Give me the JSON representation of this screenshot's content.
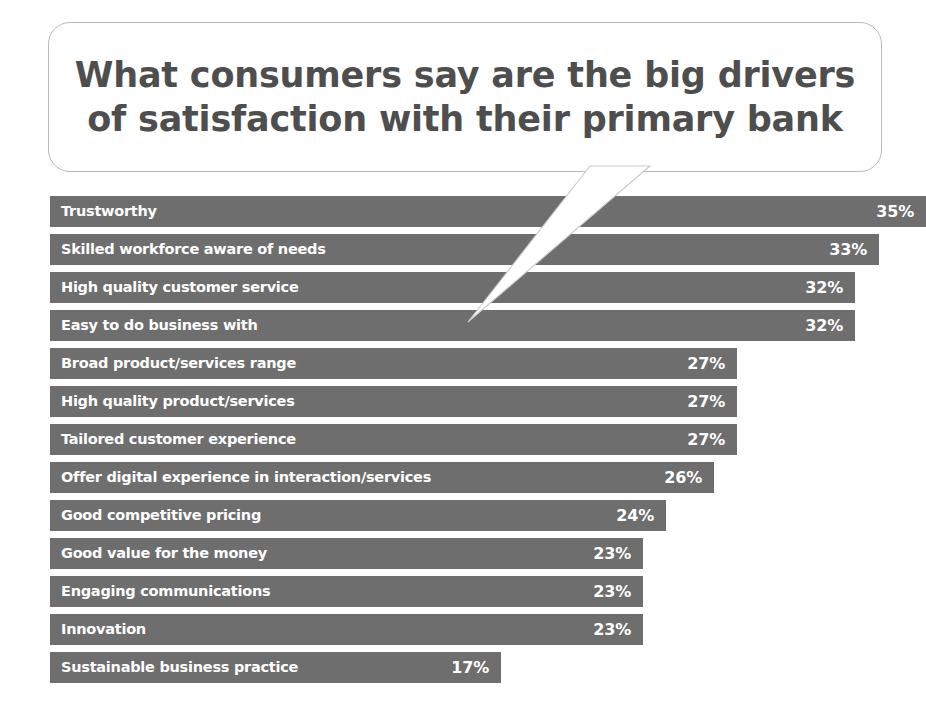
{
  "callout": {
    "title": "What consumers say are the big drivers\nof satisfaction with their primary bank",
    "border_color": "#b9b9b9",
    "text_color": "#4e4e4e"
  },
  "chart_data": {
    "type": "bar",
    "orientation": "horizontal",
    "title": "What consumers say are the big drivers of satisfaction with their primary bank",
    "xlabel": "",
    "ylabel": "",
    "xlim": [
      0,
      35
    ],
    "grid": false,
    "legend": false,
    "value_suffix": "%",
    "bar_color": "#6e6e6e",
    "label_color": "#ffffff",
    "categories": [
      "Trustworthy",
      "Skilled workforce aware of needs",
      "High quality customer service",
      "Easy to do business with",
      "Broad product/services range",
      "High quality product/services",
      "Tailored customer experience",
      "Offer digital experience in interaction/services",
      "Good competitive pricing",
      "Good value for the money",
      "Engaging communications",
      "Innovation",
      "Sustainable business practice"
    ],
    "values": [
      35,
      33,
      32,
      32,
      27,
      27,
      27,
      26,
      24,
      23,
      23,
      23,
      17
    ],
    "value_labels": [
      "35%",
      "33%",
      "32%",
      "32%",
      "27%",
      "27%",
      "27%",
      "26%",
      "24%",
      "23%",
      "23%",
      "23%",
      "17%"
    ],
    "bars": [
      {
        "label": "Trustworthy",
        "value": 35,
        "value_label": "35%"
      },
      {
        "label": "Skilled workforce aware of needs",
        "value": 33,
        "value_label": "33%"
      },
      {
        "label": "High quality customer service",
        "value": 32,
        "value_label": "32%"
      },
      {
        "label": "Easy to do business with",
        "value": 32,
        "value_label": "32%"
      },
      {
        "label": "Broad product/services range",
        "value": 27,
        "value_label": "27%"
      },
      {
        "label": "High quality product/services",
        "value": 27,
        "value_label": "27%"
      },
      {
        "label": "Tailored customer experience",
        "value": 27,
        "value_label": "27%"
      },
      {
        "label": "Offer digital experience in interaction/services",
        "value": 26,
        "value_label": "26%"
      },
      {
        "label": "Good competitive pricing",
        "value": 24,
        "value_label": "24%"
      },
      {
        "label": "Good value for the money",
        "value": 23,
        "value_label": "23%"
      },
      {
        "label": "Engaging communications",
        "value": 23,
        "value_label": "23%"
      },
      {
        "label": "Innovation",
        "value": 23,
        "value_label": "23%"
      },
      {
        "label": "Sustainable business practice",
        "value": 17,
        "value_label": "17%"
      }
    ]
  }
}
